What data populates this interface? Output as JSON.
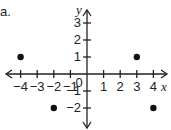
{
  "problem_label": "a.",
  "chart_data": {
    "type": "scatter",
    "title": "",
    "xlabel": "x",
    "ylabel": "y",
    "xlim": [
      -4.5,
      4.5
    ],
    "ylim": [
      -2.7,
      3.5
    ],
    "x_ticks": [
      -4,
      -3,
      -2,
      -1,
      1,
      2,
      3,
      4
    ],
    "y_ticks": [
      -2,
      -1,
      1,
      2,
      3
    ],
    "origin_label": "0",
    "points": [
      {
        "x": -4,
        "y": 1
      },
      {
        "x": 3,
        "y": 1
      },
      {
        "x": -2,
        "y": -2
      },
      {
        "x": 4,
        "y": -2
      }
    ],
    "grid": false
  }
}
